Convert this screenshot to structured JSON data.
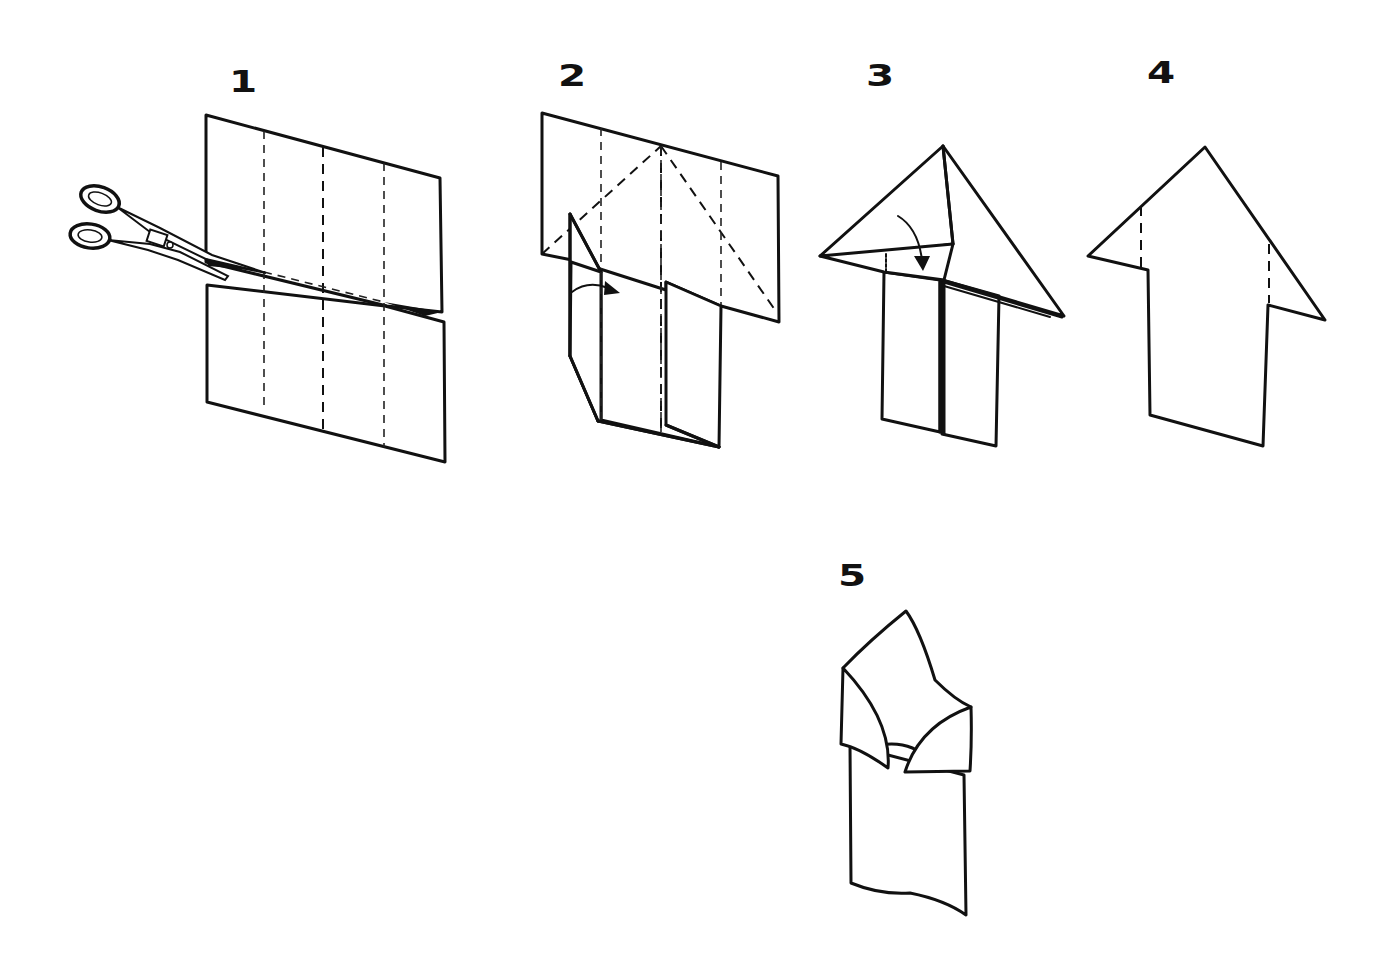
{
  "diagram": {
    "type": "folding-instructions",
    "colors": {
      "ink": "#111111",
      "paper": "#ffffff",
      "background": "#ffffff"
    },
    "steps": [
      {
        "number": "1",
        "description": "Rectangle with three vertical dashed fold lines; scissors cut along a horizontal dashed line across the middle",
        "icons": [
          "scissors-icon"
        ]
      },
      {
        "number": "2",
        "description": "Top half with two diagonal dashed fold lines meeting at top center; left lower flap folds inward with curved arrow",
        "icons": [
          "curved-arrow-icon"
        ]
      },
      {
        "number": "3",
        "description": "Top corners folded down into a triangle; curved arrow showing fold down over the body",
        "icons": [
          "curved-arrow-icon"
        ]
      },
      {
        "number": "4",
        "description": "Arrow-shaped result with two short vertical dashed fold lines on the triangle wings",
        "icons": []
      },
      {
        "number": "5",
        "description": "Finished folded shape with curled shoulder flaps",
        "icons": []
      }
    ]
  }
}
